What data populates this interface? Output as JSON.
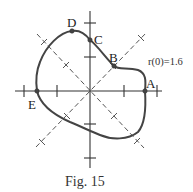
{
  "figure": {
    "caption": "Fig. 15",
    "annotation": "r(0)=1.6",
    "points": [
      {
        "label": "A"
      },
      {
        "label": "B"
      },
      {
        "label": "C"
      },
      {
        "label": "D"
      },
      {
        "label": "E"
      }
    ],
    "colors": {
      "curve": "#444444",
      "axes": "#333333",
      "dashed": "#555555",
      "background": "#ffffff"
    }
  }
}
